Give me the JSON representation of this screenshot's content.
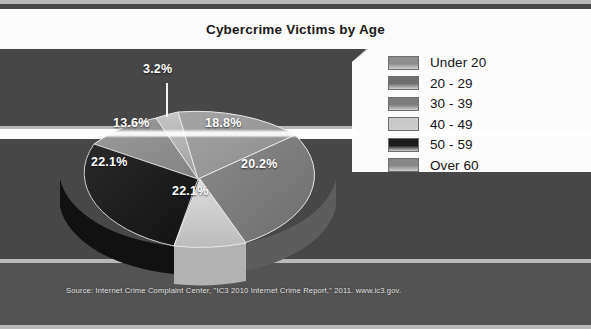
{
  "figure": {
    "title": "Cybercrime Victims by Age",
    "source_note": "Source: Internet Crime Complaint Center, \"IC3 2010 Internet Crime Report,\" 2011. www.ic3.gov."
  },
  "legend": {
    "items": [
      {
        "label": "Under 20",
        "color": "#8d8d8d"
      },
      {
        "label": "20 - 29",
        "color": "#6f6f6f"
      },
      {
        "label": "30 - 39",
        "color": "#7c7c7c"
      },
      {
        "label": "40 - 49",
        "color": "#c9c9c9"
      },
      {
        "label": "50 - 59",
        "color": "#1d1d1d"
      },
      {
        "label": "Over 60",
        "color": "#868686"
      }
    ]
  },
  "chart_data": {
    "type": "pie",
    "title": "Cybercrime Victims by Age",
    "xlabel": "",
    "ylabel": "",
    "units": "percent",
    "exploded_slice": "40 - 49",
    "three_d": true,
    "legend_position": "right",
    "categories": [
      "Under 20",
      "20 - 29",
      "30 - 39",
      "40 - 49",
      "50 - 59",
      "Over 60"
    ],
    "values": [
      3.2,
      18.8,
      20.2,
      22.1,
      22.1,
      13.6
    ],
    "labels": [
      "3.2%",
      "18.8%",
      "20.2%",
      "22.1%",
      "22.1%",
      "13.6%"
    ],
    "slice_colors": [
      "#a8a8a8",
      "#989898",
      "#7e7e7e",
      "#cfcfcf",
      "#1d1d1d",
      "#8e8e8e"
    ],
    "annotations": [
      {
        "text": "3.2%",
        "for": "Under 20",
        "leader": true
      },
      {
        "text": "18.8%",
        "for": "20 - 29",
        "leader": false
      },
      {
        "text": "20.2%",
        "for": "30 - 39",
        "leader": false
      },
      {
        "text": "22.1%",
        "for": "40 - 49",
        "leader": false
      },
      {
        "text": "22.1%",
        "for": "50 - 59",
        "leader": false
      },
      {
        "text": "13.6%",
        "for": "Over 60",
        "leader": false
      }
    ]
  },
  "colors": {
    "background_dark": "#474747",
    "background_mid": "#535353",
    "panel_white": "#fbfbfb",
    "label_text": "#ffffff"
  }
}
